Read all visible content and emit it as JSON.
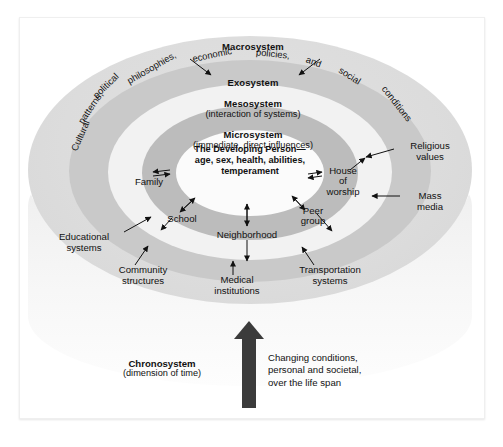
{
  "figure": {
    "background": "#ffffff",
    "frame_border": "#efefef"
  },
  "systems": [
    {
      "key": "macrosystem",
      "title": "Macrosystem",
      "subtitle": "",
      "ring_color": "#dcdcdc",
      "arc_text": "Cultural patterns, political philosophies, economic policies, and social conditions"
    },
    {
      "key": "exosystem",
      "title": "Exosystem",
      "subtitle": "",
      "ring_color": "#c9c9c9"
    },
    {
      "key": "mesosystem",
      "title": "Mesosystem",
      "subtitle": "(interaction of systems)",
      "ring_color": "#f2f2f2"
    },
    {
      "key": "microsystem",
      "title": "Microsystem",
      "subtitle": "(immediate, direct influences)",
      "ring_color": "#bcbcbc"
    }
  ],
  "core": {
    "line1": "The Developing Person—",
    "line2": "age, sex, health, abilities,",
    "line3": "temperament",
    "ring_color": "#fbfbfb"
  },
  "microsystem_nodes": [
    {
      "label": "Family"
    },
    {
      "label": "School"
    },
    {
      "label": "Neighborhood"
    },
    {
      "label": "Peer\ngroup",
      "line1": "Peer",
      "line2": "group"
    },
    {
      "label": "House of worship",
      "line1": "House",
      "line2": "of",
      "line3": "worship"
    }
  ],
  "exosystem_nodes": [
    {
      "line1": "Educational",
      "line2": "systems"
    },
    {
      "line1": "Community",
      "line2": "structures"
    },
    {
      "line1": "Medical",
      "line2": "institutions"
    },
    {
      "line1": "Transportation",
      "line2": "systems"
    },
    {
      "line1": "Religious",
      "line2": "values"
    },
    {
      "line1": "Mass",
      "line2": "media"
    }
  ],
  "chronosystem": {
    "title": "Chronosystem",
    "subtitle": "(dimension of time)",
    "description_line1": "Changing conditions,",
    "description_line2": "personal and societal,",
    "description_line3": "over the life span",
    "arrow_color": "#3b3b3b",
    "arrow_direction": "up"
  },
  "arc_words": [
    {
      "text": "Cultural",
      "x": 44,
      "y": 112,
      "rot": -66
    },
    {
      "text": "patterns,",
      "x": 52,
      "y": 84,
      "rot": -56
    },
    {
      "text": "political",
      "x": 70,
      "y": 62,
      "rot": -44
    },
    {
      "text": "philosophies,",
      "x": 104,
      "y": 44,
      "rot": -30
    },
    {
      "text": "economic",
      "x": 172,
      "y": 31,
      "rot": -12
    },
    {
      "text": "policies,",
      "x": 236,
      "y": 30,
      "rot": 6
    },
    {
      "text": "and",
      "x": 286,
      "y": 38,
      "rot": 20
    },
    {
      "text": "social",
      "x": 318,
      "y": 52,
      "rot": 32
    },
    {
      "text": "conditions",
      "x": 356,
      "y": 80,
      "rot": 52
    }
  ]
}
